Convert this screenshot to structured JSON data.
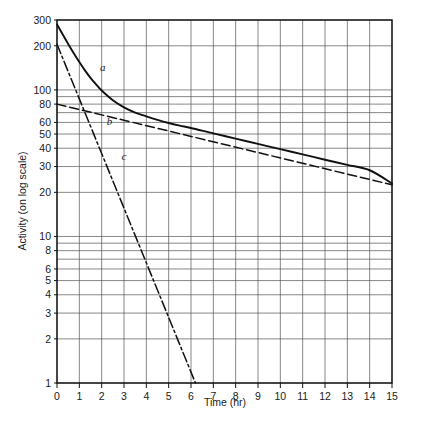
{
  "chart_data": {
    "type": "line",
    "title": "",
    "xlabel": "Time (hr)",
    "ylabel": "Activity (on log scale)",
    "yscale": "log",
    "xlim": [
      0,
      15
    ],
    "ylim": [
      1,
      300
    ],
    "grid": true,
    "legend": "inline-curve-labels",
    "x_ticks": [
      0,
      1,
      2,
      3,
      4,
      5,
      6,
      7,
      8,
      9,
      10,
      11,
      12,
      13,
      14,
      15
    ],
    "x_tick_labels": [
      "0",
      "1",
      "2",
      "3",
      "4",
      "5",
      "6",
      "7",
      "8",
      "9",
      "10",
      "11",
      "12",
      "13",
      "14",
      "15"
    ],
    "y_ticks": [
      1,
      2,
      3,
      4,
      5,
      6,
      8,
      10,
      20,
      30,
      40,
      50,
      60,
      80,
      100,
      200,
      300
    ],
    "y_tick_labels": [
      "1",
      "2",
      "3",
      "4",
      "5",
      "6",
      "8",
      "10",
      "20",
      "30",
      "40",
      "50",
      "60",
      "80",
      "100",
      "200",
      "300"
    ],
    "y_gridlines": [
      1,
      2,
      3,
      4,
      5,
      6,
      7,
      8,
      9,
      10,
      20,
      30,
      40,
      50,
      60,
      70,
      80,
      90,
      100,
      200,
      300
    ],
    "series": [
      {
        "name": "a",
        "label": "a",
        "style": "solid",
        "description": "composite total activity (sum of b and c)",
        "label_x": 2.05,
        "label_y": 135,
        "x": [
          0,
          0.25,
          0.5,
          0.75,
          1,
          1.25,
          1.5,
          1.75,
          2,
          2.5,
          3,
          3.5,
          4,
          4.5,
          5,
          5.5,
          6,
          7,
          8,
          9,
          10,
          11,
          12,
          13,
          14,
          15
        ],
        "y": [
          280,
          240,
          206,
          178,
          155,
          136,
          121,
          109,
          99,
          85,
          76,
          70,
          66,
          62.5,
          59.5,
          57,
          55,
          50.5,
          46.5,
          42.8,
          39.4,
          36.3,
          33.4,
          30.8,
          28.3,
          23.0
        ]
      },
      {
        "name": "b",
        "label": "b",
        "style": "dashed",
        "description": "long-lived component",
        "label_x": 2.35,
        "label_y": 58,
        "x": [
          0,
          15
        ],
        "y": [
          80,
          22.5
        ]
      },
      {
        "name": "c",
        "label": "c",
        "style": "dashdot",
        "description": "short-lived component",
        "label_x": 3.0,
        "label_y": 33,
        "x": [
          0,
          6.2
        ],
        "y": [
          205,
          1
        ]
      }
    ]
  },
  "axes": {
    "x_title": "Time (hr)",
    "y_title": "Activity (on log scale)"
  }
}
